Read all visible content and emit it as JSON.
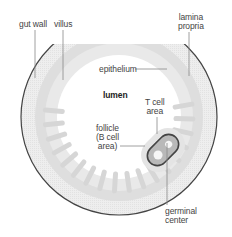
{
  "diagram": {
    "type": "anatomical cross-section",
    "colors": {
      "background": "#ffffff",
      "gut_wall": "#eeeeee",
      "lamina_propria": "#dcdcdc",
      "epithelium_villi": "#d6d6d6",
      "lumen": "#ffffff",
      "outer_border": "#333333",
      "follicle_ring": "#555555",
      "follicle_fill": "#b8b8b8",
      "germinal_center": "#f4f4f4",
      "leader_line": "#777777"
    },
    "labels": {
      "gut_wall": "gut wall",
      "villus": "villus",
      "lamina_propria": "lamina\npropria",
      "epithelium": "epithelium",
      "lumen": "lumen",
      "t_cell_area": "T cell\narea",
      "follicle": "follicle\n(B cell\narea)",
      "germinal_center": "germinal\ncenter"
    }
  }
}
